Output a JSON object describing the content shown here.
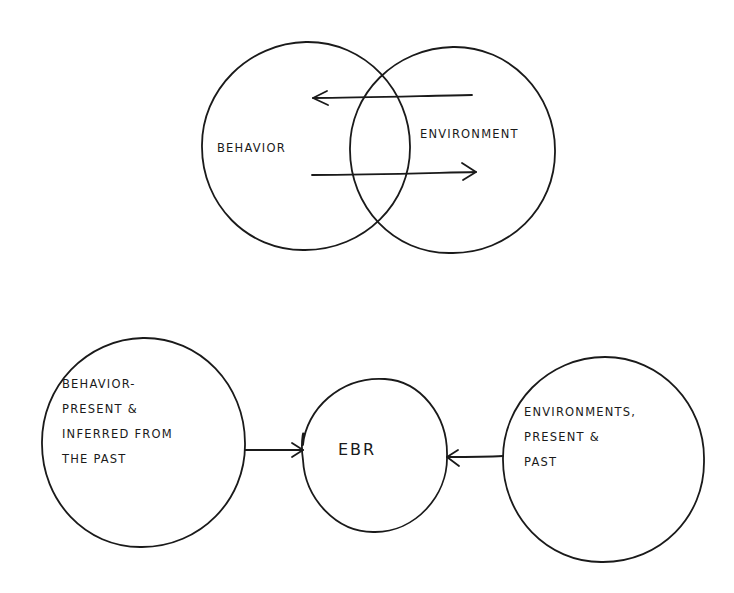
{
  "diagram": {
    "style": "hand-drawn sketch",
    "stroke_color": "#1a1a1a",
    "background": "#ffffff",
    "top_section": {
      "type": "venn",
      "circles": [
        {
          "id": "behavior",
          "label": "BEHAVIOR",
          "cx": 306,
          "cy": 146,
          "r": 104
        },
        {
          "id": "environment",
          "label": "ENVIRONMENT",
          "cx": 452,
          "cy": 150,
          "r": 103
        }
      ],
      "arrows": [
        {
          "from": "environment",
          "to": "behavior",
          "direction": "left",
          "y": 97,
          "x1": 472,
          "x2": 313
        },
        {
          "from": "behavior",
          "to": "environment",
          "direction": "right",
          "y": 173,
          "x1": 312,
          "x2": 476
        }
      ]
    },
    "bottom_section": {
      "type": "flow",
      "nodes": [
        {
          "id": "behavior-past",
          "lines": [
            "BEHAVIOR-",
            "PRESENT &",
            "INFERRED FROM",
            "THE PAST"
          ],
          "cx": 143,
          "cy": 443,
          "r": 102
        },
        {
          "id": "ebr",
          "label": "EBR",
          "cx": 375,
          "cy": 455,
          "r": 74
        },
        {
          "id": "environments-past",
          "lines": [
            "ENVIRONMENTS,",
            "PRESENT &",
            "PAST"
          ],
          "cx": 604,
          "cy": 460,
          "r": 101
        }
      ],
      "edges": [
        {
          "from": "behavior-past",
          "to": "ebr"
        },
        {
          "from": "environments-past",
          "to": "ebr"
        }
      ]
    }
  },
  "labels": {
    "behavior": "BEHAVIOR",
    "environment": "ENVIRONMENT",
    "ebr": "EBR",
    "behavior_past": "BEHAVIOR-\nPRESENT &\nINFERRED FROM\nTHE PAST",
    "environments_past": "ENVIRONMENTS,\nPRESENT &\nPAST"
  }
}
